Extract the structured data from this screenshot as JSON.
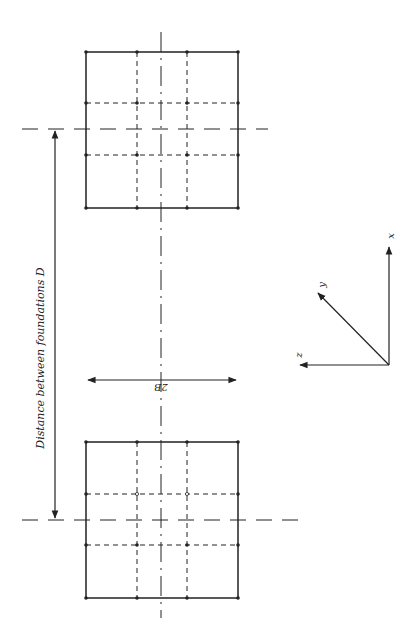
{
  "diagram": {
    "type": "engineering-plan",
    "colors": {
      "line": "#222222",
      "background": "#ffffff"
    },
    "labels": {
      "distance": "Distance between foundations D",
      "width": "2B",
      "axis_x": "x",
      "axis_y": "y",
      "axis_z": "z"
    },
    "foundations": [
      {
        "name": "foundation-top",
        "left": 86,
        "top": 52,
        "right": 238,
        "bottom": 208,
        "grid_x": [
          86,
          137,
          187,
          238
        ],
        "grid_y": [
          52,
          103,
          155,
          208
        ],
        "centerline_y": 129
      },
      {
        "name": "foundation-bottom",
        "left": 86,
        "top": 442,
        "right": 238,
        "bottom": 598,
        "grid_x": [
          86,
          137,
          187,
          238
        ],
        "grid_y": [
          442,
          494,
          545,
          598
        ],
        "centerline_y": 520
      }
    ],
    "centerline_x": 161,
    "dimension_D": {
      "x": 55,
      "y1": 129,
      "y2": 520
    },
    "dimension_2B": {
      "y": 380,
      "x1": 86,
      "x2": 238
    },
    "axes": {
      "origin": [
        389,
        365
      ],
      "x_tip": [
        389,
        245
      ],
      "y_tip": [
        316,
        291
      ],
      "z_tip": [
        298,
        365
      ]
    }
  }
}
